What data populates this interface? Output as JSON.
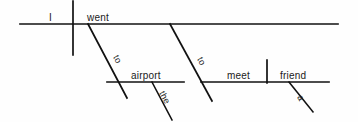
{
  "diagram": {
    "type": "sentence-diagram",
    "style": "Reed-Kellogg",
    "sentence": "I went to the airport to meet a friend",
    "canvas": {
      "width": 358,
      "height": 122
    },
    "colors": {
      "ink": "#111111",
      "background": "#fefefe",
      "text": "#1a1a1a"
    },
    "words": {
      "subject": "I",
      "verb": "went",
      "preposition_1": "to",
      "article_1": "the",
      "object_of_preposition_1": "airport",
      "preposition_2": "to",
      "object_of_preposition_2": "meet",
      "article_2": "a",
      "direct_object": "friend"
    },
    "labels": [
      {
        "name": "subject",
        "text": "I",
        "x": 49,
        "y": 21,
        "rotation": 0
      },
      {
        "name": "verb",
        "text": "went",
        "x": 87,
        "y": 21,
        "rotation": 0
      },
      {
        "name": "preposition-1",
        "text": "to",
        "x": 113,
        "y": 57,
        "rotation": 62
      },
      {
        "name": "prep-object-1",
        "text": "airport",
        "x": 131,
        "y": 79,
        "rotation": 0
      },
      {
        "name": "article-the",
        "text": "the",
        "x": 159,
        "y": 93,
        "rotation": 62
      },
      {
        "name": "preposition-2",
        "text": "to",
        "x": 197,
        "y": 59,
        "rotation": 62
      },
      {
        "name": "prep-object-2",
        "text": "meet",
        "x": 227,
        "y": 79,
        "rotation": 0
      },
      {
        "name": "direct-object",
        "text": "friend",
        "x": 280,
        "y": 79,
        "rotation": 0
      },
      {
        "name": "article-a",
        "text": "a",
        "x": 297,
        "y": 97,
        "rotation": 62
      }
    ],
    "lines": {
      "main_baseline": {
        "x1": 20,
        "y1": 24,
        "x2": 338,
        "y2": 24
      },
      "subject_verb_divider": {
        "x1": 73,
        "y1": 1,
        "x2": 73,
        "y2": 55
      },
      "prep_slant_1": {
        "x1": 88,
        "y1": 24,
        "x2": 127,
        "y2": 98
      },
      "prep_phrase_baseline_1": {
        "x1": 107,
        "y1": 82,
        "x2": 184,
        "y2": 82
      },
      "article_slant_the": {
        "x1": 152,
        "y1": 82,
        "x2": 172,
        "y2": 120
      },
      "prep_slant_2": {
        "x1": 170,
        "y1": 24,
        "x2": 212,
        "y2": 101
      },
      "prep_phrase_baseline_2": {
        "x1": 201,
        "y1": 82,
        "x2": 329,
        "y2": 82
      },
      "verb_object_divider": {
        "x1": 267,
        "y1": 60,
        "x2": 267,
        "y2": 83
      },
      "article_slant_a": {
        "x1": 289,
        "y1": 82,
        "x2": 313,
        "y2": 112
      }
    }
  }
}
